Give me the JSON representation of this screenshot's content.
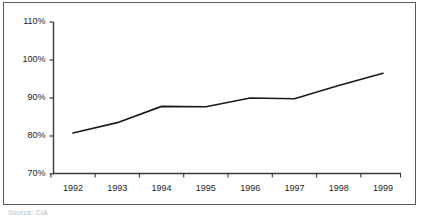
{
  "chart_data": {
    "type": "line",
    "title": "",
    "subtitle": "",
    "xlabel": "",
    "ylabel": "",
    "categories": [
      "1992",
      "1993",
      "1994",
      "1995",
      "1996",
      "1997",
      "1998",
      "1999"
    ],
    "x": [
      1992,
      1993,
      1994,
      1995,
      1996,
      1997,
      1998,
      1999
    ],
    "values": [
      80.8,
      83.5,
      87.8,
      87.7,
      90.0,
      89.8,
      93.3,
      96.5
    ],
    "series": [
      {
        "name": "",
        "values": [
          80.8,
          83.5,
          87.8,
          87.7,
          90.0,
          89.8,
          93.3,
          96.5
        ],
        "color": "#1a1a1a"
      }
    ],
    "ylim": [
      70,
      115
    ],
    "xlim": [
      1991.5,
      1999.6
    ],
    "yticks": [
      70,
      80,
      90,
      100,
      110
    ],
    "ytick_labels": [
      "70%",
      "80%",
      "90%",
      "100%",
      "110%"
    ],
    "xtick_labels": [
      "1992",
      "1993",
      "1994",
      "1995",
      "1996",
      "1997",
      "1998",
      "1999"
    ],
    "grid": false,
    "legend": false,
    "legend_position": "none",
    "annotations": []
  },
  "figure": {
    "caption": "Source: CIA",
    "line_color": "#1a1a1a",
    "axis_color": "#3a3a3a",
    "border_color": "#5a5a5a",
    "background": "#ffffff"
  }
}
